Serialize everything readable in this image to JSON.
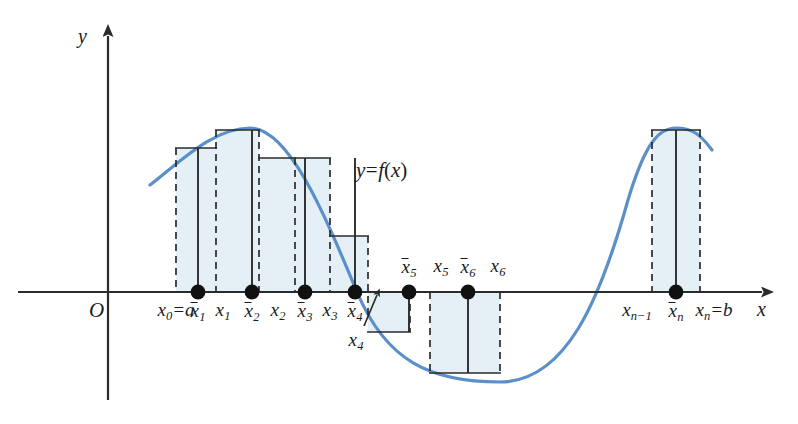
{
  "figure": {
    "background_color": "#ffffff"
  },
  "colors": {
    "curve": "#5b8fc7",
    "rect_fill": "#e4f0f5",
    "rect_stroke": "#2b2b2b",
    "axis": "#2b2b2b",
    "text": "#1b1b1b",
    "dot": "#111111"
  },
  "axes": {
    "x_label": "x",
    "y_label": "y",
    "origin_label": "O",
    "x_axis_y_px": 292,
    "y_axis_x_px": 108,
    "x_axis_from_px": 18,
    "x_axis_to_px": 772,
    "y_axis_from_px": 400,
    "y_axis_to_px": 26
  },
  "function_label": {
    "text_plain": "y=f(x)",
    "lhs": "y",
    "eq": "=",
    "fn": "f",
    "open": "(",
    "arg": "x",
    "close": ")"
  },
  "partition_labels": [
    {
      "name": "x0-equals-a",
      "base": "x",
      "sub": "0",
      "suffix": "=a",
      "overbar": false,
      "x_px": 176,
      "align": "center"
    },
    {
      "name": "xbar1",
      "base": "x",
      "sub": "1",
      "suffix": "",
      "overbar": true,
      "x_px": 198,
      "align": "center"
    },
    {
      "name": "x1",
      "base": "x",
      "sub": "1",
      "suffix": "",
      "overbar": false,
      "x_px": 223,
      "align": "center"
    },
    {
      "name": "xbar2",
      "base": "x",
      "sub": "2",
      "suffix": "",
      "overbar": true,
      "x_px": 252,
      "align": "center"
    },
    {
      "name": "x2",
      "base": "x",
      "sub": "2",
      "suffix": "",
      "overbar": false,
      "x_px": 278,
      "align": "center"
    },
    {
      "name": "xbar3",
      "base": "x",
      "sub": "3",
      "suffix": "",
      "overbar": true,
      "x_px": 305,
      "align": "center"
    },
    {
      "name": "x3",
      "base": "x",
      "sub": "3",
      "suffix": "",
      "overbar": false,
      "x_px": 330,
      "align": "center"
    },
    {
      "name": "xbar4",
      "base": "x",
      "sub": "4",
      "suffix": "",
      "overbar": true,
      "x_px": 355,
      "align": "center"
    },
    {
      "name": "xbar5",
      "base": "x",
      "sub": "5",
      "suffix": "",
      "overbar": true,
      "x_px": 409,
      "align": "center"
    },
    {
      "name": "x5",
      "base": "x",
      "sub": "5",
      "suffix": "",
      "overbar": false,
      "x_px": 441,
      "align": "center"
    },
    {
      "name": "xbar6",
      "base": "x",
      "sub": "6",
      "suffix": "",
      "overbar": true,
      "x_px": 468,
      "align": "center"
    },
    {
      "name": "x6",
      "base": "x",
      "sub": "6",
      "suffix": "",
      "overbar": false,
      "x_px": 498,
      "align": "center"
    },
    {
      "name": "xn-minus-1",
      "base": "x",
      "sub": "n−1",
      "suffix": "",
      "overbar": false,
      "x_px": 637,
      "align": "center"
    },
    {
      "name": "xbarn",
      "base": "x",
      "sub": "n",
      "suffix": "",
      "overbar": true,
      "x_px": 676,
      "align": "center"
    },
    {
      "name": "xn-equals-b",
      "base": "x",
      "sub": "n",
      "suffix": "=b",
      "overbar": false,
      "x_px": 714,
      "align": "center"
    }
  ],
  "callout_x4": {
    "base": "x",
    "sub": "4",
    "x_px": 362,
    "y_px": 330
  },
  "chart_data": {
    "type": "area",
    "xlabel": "x",
    "ylabel": "y",
    "grid": false,
    "legend": null,
    "curve_name": "y=f(x)",
    "partition_points_px": [
      176,
      216,
      259,
      295,
      330,
      368,
      410,
      458,
      500,
      652,
      700
    ],
    "partition_points_label": [
      "x0=a",
      "x1",
      "x2",
      "x3",
      "x4",
      "x5",
      "x6",
      "",
      "",
      "xn-1",
      "xn=b"
    ],
    "sample_points_px": [
      198,
      252,
      305,
      355,
      409,
      468,
      676
    ],
    "sample_points_label": [
      "x̄1",
      "x̄2",
      "x̄3",
      "x̄4",
      "x̄5",
      "x̄6",
      "x̄n"
    ],
    "rectangles": [
      {
        "index": 1,
        "label": "x̄1",
        "x_left_px": 176,
        "x_right_px": 216,
        "top_px": 148,
        "signed": "positive"
      },
      {
        "index": 2,
        "label": "x̄2",
        "x_left_px": 216,
        "x_right_px": 259,
        "top_px": 130,
        "signed": "positive"
      },
      {
        "index": 3,
        "label": "x̄3",
        "x_left_px": 259,
        "x_right_px": 295,
        "top_px": 158,
        "signed": "positive"
      },
      {
        "index": 4,
        "label": "x̄4",
        "x_left_px": 295,
        "x_right_px": 330,
        "top_px": 158,
        "signed": "positive"
      },
      {
        "index": 5,
        "label": "x̄4b",
        "x_left_px": 330,
        "x_right_px": 368,
        "top_px": 236,
        "signed": "positive"
      },
      {
        "index": 6,
        "label": "x̄5",
        "x_left_px": 368,
        "x_right_px": 410,
        "top_px": 332,
        "signed": "negative"
      },
      {
        "index": 7,
        "label": "x̄6",
        "x_left_px": 430,
        "x_right_px": 500,
        "top_px": 373,
        "signed": "negative"
      },
      {
        "index": 8,
        "label": "x̄n",
        "x_left_px": 652,
        "x_right_px": 700,
        "top_px": 130,
        "signed": "positive"
      }
    ],
    "axis_y_px": 292,
    "curve_zero_crossings_px": [
      357,
      577
    ],
    "curve_peak_px": {
      "x": 250,
      "y": 128
    },
    "curve_trough_px": {
      "x": 500,
      "y": 382
    },
    "curve_peak2_px": {
      "x": 676,
      "y": 128
    }
  }
}
